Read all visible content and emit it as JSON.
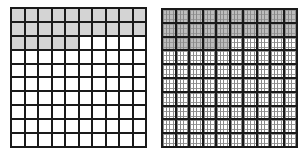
{
  "figure": {
    "left_grid": {
      "name": "hundredths-grid",
      "rows": 10,
      "cols": 10,
      "shaded_cells": 25,
      "total_cells": 100,
      "shaded_pattern": "rows 1-2 fully shaded, first 5 cells of row 3 shaded",
      "shade_color": "#d4d4d4",
      "line_color": "#1a1a1a"
    },
    "right_grid": {
      "name": "thousandths-grid",
      "rows": 10,
      "cols": 10,
      "subdivided": true,
      "shaded_cells": 25,
      "total_cells": 100,
      "shaded_pattern": "rows 1-2 fully shaded, first 5 cells of row 3 shaded",
      "shade_color": "#bdbdbd",
      "line_color": "#1a1a1a"
    }
  }
}
